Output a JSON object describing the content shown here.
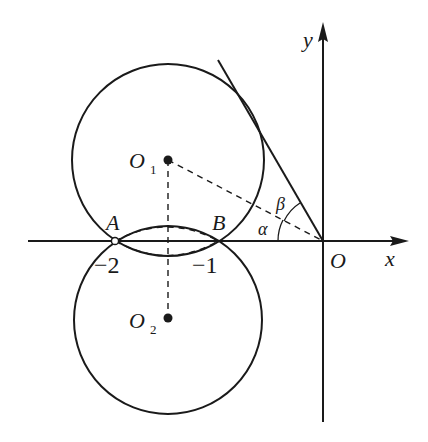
{
  "figure": {
    "axes": {
      "x_label": "x",
      "y_label": "y",
      "origin_label": "O"
    },
    "points": {
      "A": "A",
      "B": "B",
      "O1": "O",
      "O1_sub": "1",
      "O2": "O",
      "O2_sub": "2"
    },
    "ticks": {
      "minus_two": "−2",
      "minus_one": "−1"
    },
    "angles": {
      "alpha": "α",
      "beta": "β"
    },
    "colors": {
      "ink": "#1a1a1a",
      "background": "#ffffff"
    }
  }
}
